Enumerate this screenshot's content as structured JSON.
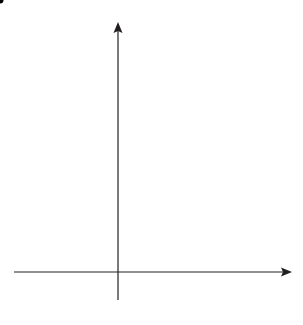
{
  "diagram": {
    "type": "coordinate-grid",
    "x_axis": {
      "label": "x",
      "ticks": [
        "−2",
        "−1",
        "1",
        "2",
        "3",
        "4"
      ],
      "tick_values": [
        -2,
        -1,
        1,
        2,
        3,
        4
      ],
      "range": [
        -3,
        5
      ]
    },
    "y_axis": {
      "label": "y",
      "ticks": [
        "1",
        "2",
        "3",
        "4",
        "5",
        "6"
      ],
      "tick_values": [
        1,
        2,
        3,
        4,
        5,
        6
      ],
      "range": [
        0,
        7
      ]
    },
    "origin_label": "0",
    "point": {
      "label": "C",
      "x": 1,
      "y": 2,
      "color": "#e8442c"
    },
    "shape": {
      "name": "trapezium",
      "vertices": [
        [
          2,
          3
        ],
        [
          3,
          3
        ],
        [
          4,
          2
        ],
        [
          2,
          2
        ]
      ],
      "fill": "#dff4f6",
      "stroke": "#231f20"
    },
    "grid_color": "#d6f1f4"
  }
}
